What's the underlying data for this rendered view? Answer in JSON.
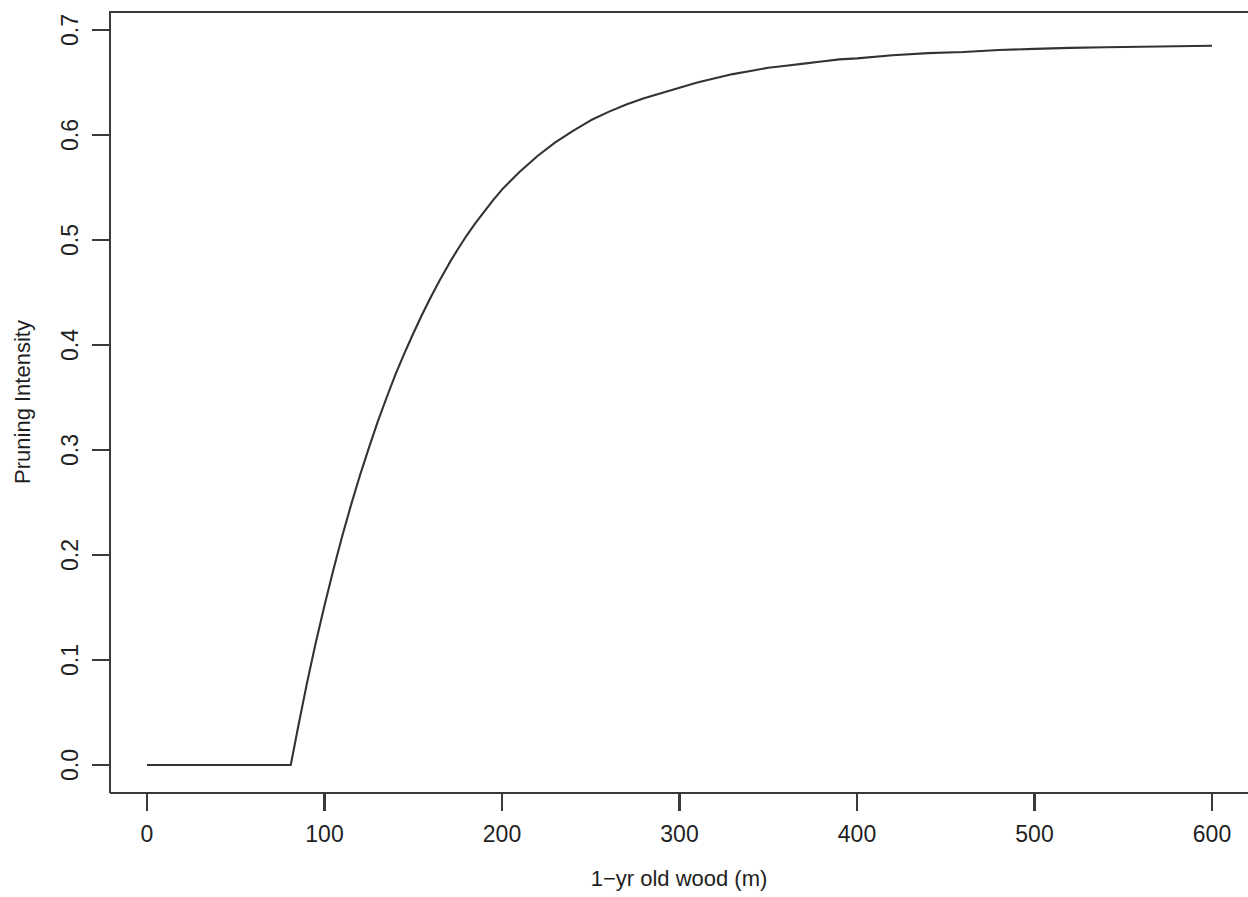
{
  "chart_data": {
    "type": "line",
    "title": "",
    "subtitle": "",
    "xlabel": "1−yr old wood (m)",
    "ylabel": "Pruning Intensity",
    "xlim": [
      0,
      620
    ],
    "ylim": [
      0.0,
      0.72
    ],
    "grid": false,
    "legend": null,
    "legend_position": "none",
    "xticks": [
      0,
      100,
      200,
      300,
      400,
      500,
      600
    ],
    "xticklabels": [
      "0",
      "100",
      "200",
      "300",
      "400",
      "500",
      "600"
    ],
    "yticks": [
      0.0,
      0.1,
      0.2,
      0.3,
      0.4,
      0.5,
      0.6,
      0.7
    ],
    "yticklabels": [
      "0.0",
      "0.1",
      "0.2",
      "0.3",
      "0.4",
      "0.5",
      "0.6",
      "0.7"
    ],
    "ytick_label_rotation": 90,
    "line_color": "#333333",
    "axis_color": "#3a3a3a",
    "background_color": "#ffffff",
    "box_type": "upper-left-open-right",
    "threshold_x": 81,
    "plateau_y": 0.685,
    "series": [
      {
        "name": "Pruning Intensity",
        "x": [
          0,
          10,
          20,
          30,
          40,
          50,
          60,
          70,
          81,
          85,
          90,
          95,
          100,
          105,
          110,
          115,
          120,
          125,
          130,
          135,
          140,
          145,
          150,
          155,
          160,
          165,
          170,
          175,
          180,
          185,
          190,
          195,
          200,
          210,
          220,
          230,
          240,
          250,
          260,
          270,
          280,
          290,
          300,
          310,
          320,
          330,
          340,
          350,
          360,
          370,
          380,
          390,
          400,
          420,
          440,
          460,
          480,
          500,
          520,
          540,
          560,
          580,
          600
        ],
        "values": [
          0.0,
          0.0,
          0.0,
          0.0,
          0.0,
          0.0,
          0.0,
          0.0,
          0.0,
          0.035,
          0.077,
          0.116,
          0.152,
          0.186,
          0.218,
          0.248,
          0.276,
          0.302,
          0.327,
          0.35,
          0.372,
          0.392,
          0.411,
          0.429,
          0.446,
          0.462,
          0.477,
          0.491,
          0.504,
          0.516,
          0.527,
          0.538,
          0.548,
          0.565,
          0.58,
          0.593,
          0.604,
          0.614,
          0.622,
          0.629,
          0.635,
          0.64,
          0.645,
          0.65,
          0.654,
          0.658,
          0.661,
          0.664,
          0.666,
          0.668,
          0.67,
          0.672,
          0.673,
          0.676,
          0.678,
          0.679,
          0.681,
          0.682,
          0.683,
          0.6835,
          0.684,
          0.6845,
          0.685
        ]
      }
    ]
  }
}
